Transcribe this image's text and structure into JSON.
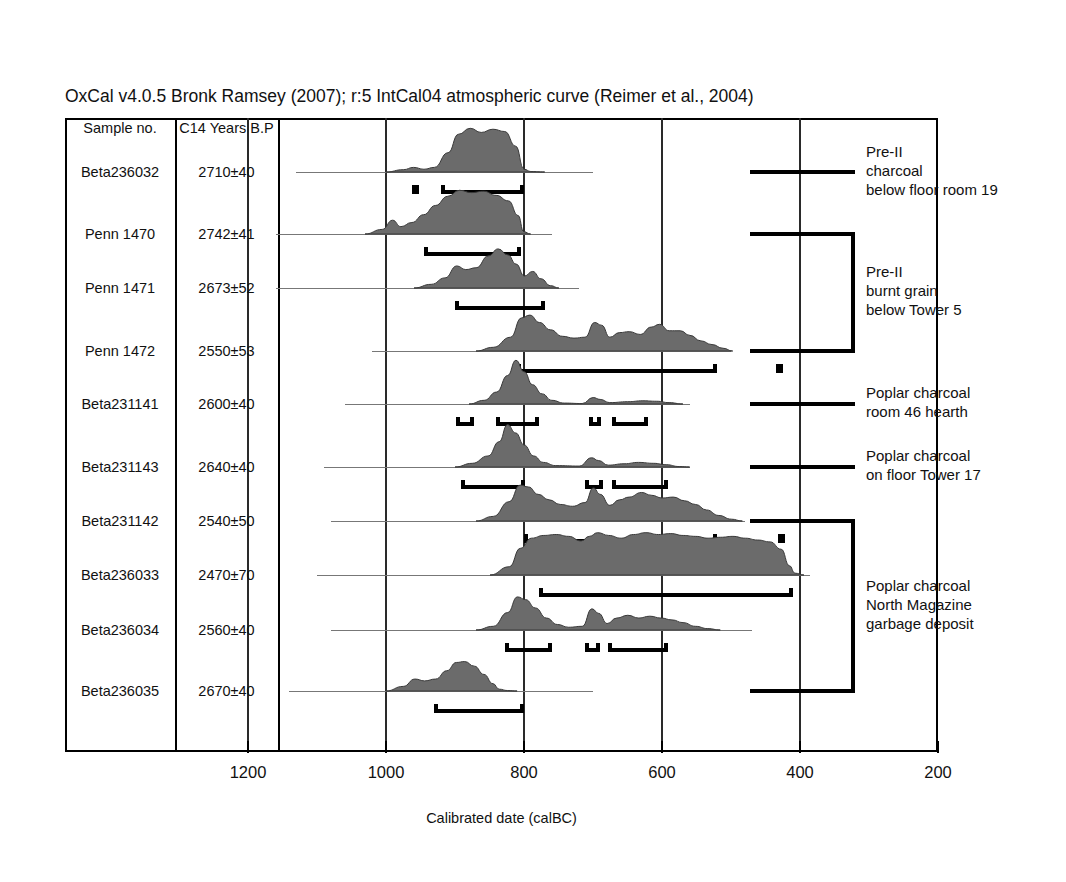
{
  "title": "OxCal v4.0.5 Bronk Ramsey (2007); r:5 IntCal04 atmospheric curve (Reimer et al., 2004)",
  "axis": {
    "label": "Calibrated date (calBC)",
    "ticks": [
      "1200",
      "1000",
      "800",
      "600",
      "400",
      "200"
    ],
    "range_left_calbc": 1330,
    "range_right_calbc": 200,
    "minor_tick_step": 20
  },
  "table": {
    "headers": [
      "Sample no.",
      "C14 Years B.P"
    ]
  },
  "samples": [
    {
      "name": "Beta236032",
      "c14": "2710±40"
    },
    {
      "name": "Penn 1470",
      "c14": "2742±41"
    },
    {
      "name": "Penn 1471",
      "c14": "2673±52"
    },
    {
      "name": "Penn 1472",
      "c14": "2550±53"
    },
    {
      "name": "Beta231141",
      "c14": "2600±40"
    },
    {
      "name": "Beta231143",
      "c14": "2640±40"
    },
    {
      "name": "Beta231142",
      "c14": "2540±50"
    },
    {
      "name": "Beta236033",
      "c14": "2470±70"
    },
    {
      "name": "Beta236034",
      "c14": "2560±40"
    },
    {
      "name": "Beta236035",
      "c14": "2670±40"
    }
  ],
  "groups": [
    {
      "label_lines": [
        "Pre-II",
        "charcoal",
        "below floor room 19"
      ],
      "rows": [
        0,
        0
      ]
    },
    {
      "label_lines": [
        "Pre-II",
        "burnt grain",
        "below Tower 5"
      ],
      "rows": [
        1,
        3
      ]
    },
    {
      "label_lines": [
        "Poplar charcoal",
        "room 46 hearth"
      ],
      "rows": [
        4,
        4
      ]
    },
    {
      "label_lines": [
        "Poplar charcoal",
        "on floor Tower 17"
      ],
      "rows": [
        5,
        5
      ]
    },
    {
      "label_lines": [
        "Poplar charcoal",
        "North Magazine",
        "garbage deposit"
      ],
      "rows": [
        6,
        9
      ]
    }
  ],
  "chart_data": {
    "type": "area",
    "title": "OxCal v4.0.5 Bronk Ramsey (2007); r:5 IntCal04 atmospheric curve (Reimer et al., 2004)",
    "xlabel": "Calibrated date (calBC)",
    "ylabel": "",
    "xlim": [
      1330,
      200
    ],
    "x_axis_direction": "reversed",
    "grid": true,
    "gridlines_calbc": [
      1200,
      1000,
      800,
      600,
      400
    ],
    "legend": "none",
    "series": [
      {
        "name": "Beta236032",
        "c14_age_bp": 2710,
        "c14_error": 40,
        "baseline_calbc": [
          1130,
          700
        ],
        "pdf_calbc": [
          {
            "x": 1000,
            "y": 0.0
          },
          {
            "x": 975,
            "y": 0.05
          },
          {
            "x": 960,
            "y": 0.1
          },
          {
            "x": 945,
            "y": 0.06
          },
          {
            "x": 930,
            "y": 0.1
          },
          {
            "x": 910,
            "y": 0.42
          },
          {
            "x": 895,
            "y": 0.82
          },
          {
            "x": 878,
            "y": 0.95
          },
          {
            "x": 862,
            "y": 0.86
          },
          {
            "x": 845,
            "y": 0.93
          },
          {
            "x": 828,
            "y": 0.88
          },
          {
            "x": 812,
            "y": 0.56
          },
          {
            "x": 800,
            "y": 0.06
          },
          {
            "x": 790,
            "y": 0.01
          },
          {
            "x": 770,
            "y": 0.0
          }
        ],
        "ranges_calbc": [
          [
            963,
            952
          ],
          [
            920,
            800
          ]
        ]
      },
      {
        "name": "Penn 1470",
        "c14_age_bp": 2742,
        "c14_error": 41,
        "baseline_calbc": [
          1160,
          760
        ],
        "pdf_calbc": [
          {
            "x": 1030,
            "y": 0.0
          },
          {
            "x": 1005,
            "y": 0.1
          },
          {
            "x": 990,
            "y": 0.3
          },
          {
            "x": 978,
            "y": 0.16
          },
          {
            "x": 962,
            "y": 0.25
          },
          {
            "x": 945,
            "y": 0.42
          },
          {
            "x": 928,
            "y": 0.62
          },
          {
            "x": 910,
            "y": 0.82
          },
          {
            "x": 893,
            "y": 0.95
          },
          {
            "x": 876,
            "y": 0.9
          },
          {
            "x": 858,
            "y": 0.93
          },
          {
            "x": 840,
            "y": 0.84
          },
          {
            "x": 822,
            "y": 0.72
          },
          {
            "x": 808,
            "y": 0.4
          },
          {
            "x": 800,
            "y": 0.05
          },
          {
            "x": 790,
            "y": 0.0
          }
        ],
        "ranges_calbc": [
          [
            945,
            805
          ]
        ]
      },
      {
        "name": "Penn 1471",
        "c14_age_bp": 2673,
        "c14_error": 52,
        "baseline_calbc": [
          1160,
          720
        ],
        "pdf_calbc": [
          {
            "x": 960,
            "y": 0.0
          },
          {
            "x": 935,
            "y": 0.08
          },
          {
            "x": 915,
            "y": 0.22
          },
          {
            "x": 898,
            "y": 0.48
          },
          {
            "x": 885,
            "y": 0.4
          },
          {
            "x": 870,
            "y": 0.44
          },
          {
            "x": 852,
            "y": 0.7
          },
          {
            "x": 838,
            "y": 0.85
          },
          {
            "x": 824,
            "y": 0.72
          },
          {
            "x": 812,
            "y": 0.52
          },
          {
            "x": 800,
            "y": 0.26
          },
          {
            "x": 788,
            "y": 0.36
          },
          {
            "x": 776,
            "y": 0.2
          },
          {
            "x": 762,
            "y": 0.05
          },
          {
            "x": 750,
            "y": 0.0
          }
        ],
        "ranges_calbc": [
          [
            900,
            770
          ]
        ]
      },
      {
        "name": "Penn 1472",
        "c14_age_bp": 2550,
        "c14_error": 53,
        "baseline_calbc": [
          1020,
          500
        ],
        "pdf_calbc": [
          {
            "x": 870,
            "y": 0.0
          },
          {
            "x": 845,
            "y": 0.08
          },
          {
            "x": 820,
            "y": 0.3
          },
          {
            "x": 804,
            "y": 0.72
          },
          {
            "x": 792,
            "y": 0.78
          },
          {
            "x": 778,
            "y": 0.62
          },
          {
            "x": 762,
            "y": 0.46
          },
          {
            "x": 745,
            "y": 0.32
          },
          {
            "x": 728,
            "y": 0.28
          },
          {
            "x": 712,
            "y": 0.3
          },
          {
            "x": 698,
            "y": 0.62
          },
          {
            "x": 688,
            "y": 0.56
          },
          {
            "x": 676,
            "y": 0.3
          },
          {
            "x": 662,
            "y": 0.4
          },
          {
            "x": 648,
            "y": 0.42
          },
          {
            "x": 632,
            "y": 0.36
          },
          {
            "x": 616,
            "y": 0.52
          },
          {
            "x": 604,
            "y": 0.58
          },
          {
            "x": 590,
            "y": 0.44
          },
          {
            "x": 574,
            "y": 0.44
          },
          {
            "x": 560,
            "y": 0.34
          },
          {
            "x": 544,
            "y": 0.22
          },
          {
            "x": 528,
            "y": 0.14
          },
          {
            "x": 512,
            "y": 0.06
          },
          {
            "x": 498,
            "y": 0.0
          }
        ],
        "ranges_calbc": [
          [
            810,
            520
          ],
          [
            435,
            425
          ]
        ]
      },
      {
        "name": "Beta231141",
        "c14_age_bp": 2600,
        "c14_error": 40,
        "baseline_calbc": [
          1060,
          560
        ],
        "pdf_calbc": [
          {
            "x": 880,
            "y": 0.0
          },
          {
            "x": 858,
            "y": 0.08
          },
          {
            "x": 840,
            "y": 0.26
          },
          {
            "x": 824,
            "y": 0.62
          },
          {
            "x": 812,
            "y": 0.95
          },
          {
            "x": 800,
            "y": 0.7
          },
          {
            "x": 788,
            "y": 0.42
          },
          {
            "x": 774,
            "y": 0.22
          },
          {
            "x": 760,
            "y": 0.08
          },
          {
            "x": 742,
            "y": 0.02
          },
          {
            "x": 716,
            "y": 0.01
          },
          {
            "x": 700,
            "y": 0.14
          },
          {
            "x": 690,
            "y": 0.1
          },
          {
            "x": 676,
            "y": 0.03
          },
          {
            "x": 650,
            "y": 0.05
          },
          {
            "x": 628,
            "y": 0.07
          },
          {
            "x": 608,
            "y": 0.06
          },
          {
            "x": 590,
            "y": 0.03
          },
          {
            "x": 570,
            "y": 0.0
          }
        ],
        "ranges_calbc": [
          [
            898,
            872
          ],
          [
            840,
            778
          ],
          [
            706,
            688
          ],
          [
            672,
            620
          ]
        ]
      },
      {
        "name": "Beta231143",
        "c14_age_bp": 2640,
        "c14_error": 40,
        "baseline_calbc": [
          1090,
          560
        ],
        "pdf_calbc": [
          {
            "x": 900,
            "y": 0.0
          },
          {
            "x": 875,
            "y": 0.08
          },
          {
            "x": 852,
            "y": 0.24
          },
          {
            "x": 836,
            "y": 0.55
          },
          {
            "x": 824,
            "y": 0.92
          },
          {
            "x": 812,
            "y": 0.74
          },
          {
            "x": 800,
            "y": 0.48
          },
          {
            "x": 786,
            "y": 0.24
          },
          {
            "x": 772,
            "y": 0.1
          },
          {
            "x": 754,
            "y": 0.03
          },
          {
            "x": 720,
            "y": 0.02
          },
          {
            "x": 702,
            "y": 0.2
          },
          {
            "x": 692,
            "y": 0.14
          },
          {
            "x": 678,
            "y": 0.04
          },
          {
            "x": 655,
            "y": 0.07
          },
          {
            "x": 634,
            "y": 0.1
          },
          {
            "x": 612,
            "y": 0.08
          },
          {
            "x": 594,
            "y": 0.05
          },
          {
            "x": 575,
            "y": 0.01
          },
          {
            "x": 560,
            "y": 0.0
          }
        ],
        "ranges_calbc": [
          [
            892,
            798
          ],
          [
            712,
            686
          ],
          [
            672,
            592
          ]
        ]
      },
      {
        "name": "Beta231142",
        "c14_age_bp": 2540,
        "c14_error": 50,
        "baseline_calbc": [
          1080,
          480
        ],
        "pdf_calbc": [
          {
            "x": 870,
            "y": 0.0
          },
          {
            "x": 845,
            "y": 0.1
          },
          {
            "x": 822,
            "y": 0.42
          },
          {
            "x": 806,
            "y": 0.78
          },
          {
            "x": 794,
            "y": 0.74
          },
          {
            "x": 780,
            "y": 0.58
          },
          {
            "x": 764,
            "y": 0.46
          },
          {
            "x": 748,
            "y": 0.36
          },
          {
            "x": 730,
            "y": 0.32
          },
          {
            "x": 712,
            "y": 0.4
          },
          {
            "x": 700,
            "y": 0.72
          },
          {
            "x": 690,
            "y": 0.58
          },
          {
            "x": 676,
            "y": 0.34
          },
          {
            "x": 662,
            "y": 0.46
          },
          {
            "x": 648,
            "y": 0.52
          },
          {
            "x": 630,
            "y": 0.62
          },
          {
            "x": 616,
            "y": 0.56
          },
          {
            "x": 600,
            "y": 0.5
          },
          {
            "x": 584,
            "y": 0.52
          },
          {
            "x": 568,
            "y": 0.44
          },
          {
            "x": 552,
            "y": 0.36
          },
          {
            "x": 536,
            "y": 0.24
          },
          {
            "x": 518,
            "y": 0.12
          },
          {
            "x": 500,
            "y": 0.04
          },
          {
            "x": 484,
            "y": 0.0
          }
        ],
        "ranges_calbc": [
          [
            800,
            520
          ],
          [
            432,
            422
          ]
        ]
      },
      {
        "name": "Beta236033",
        "c14_age_bp": 2470,
        "c14_error": 70,
        "baseline_calbc": [
          1100,
          385
        ],
        "pdf_calbc": [
          {
            "x": 850,
            "y": 0.0
          },
          {
            "x": 822,
            "y": 0.18
          },
          {
            "x": 806,
            "y": 0.58
          },
          {
            "x": 790,
            "y": 0.8
          },
          {
            "x": 772,
            "y": 0.86
          },
          {
            "x": 754,
            "y": 0.88
          },
          {
            "x": 736,
            "y": 0.84
          },
          {
            "x": 718,
            "y": 0.74
          },
          {
            "x": 706,
            "y": 0.84
          },
          {
            "x": 694,
            "y": 0.92
          },
          {
            "x": 678,
            "y": 0.86
          },
          {
            "x": 660,
            "y": 0.8
          },
          {
            "x": 642,
            "y": 0.88
          },
          {
            "x": 624,
            "y": 0.92
          },
          {
            "x": 606,
            "y": 0.88
          },
          {
            "x": 588,
            "y": 0.9
          },
          {
            "x": 570,
            "y": 0.86
          },
          {
            "x": 552,
            "y": 0.84
          },
          {
            "x": 534,
            "y": 0.8
          },
          {
            "x": 516,
            "y": 0.82
          },
          {
            "x": 498,
            "y": 0.84
          },
          {
            "x": 480,
            "y": 0.8
          },
          {
            "x": 462,
            "y": 0.76
          },
          {
            "x": 444,
            "y": 0.72
          },
          {
            "x": 428,
            "y": 0.56
          },
          {
            "x": 416,
            "y": 0.2
          },
          {
            "x": 408,
            "y": 0.04
          },
          {
            "x": 395,
            "y": 0.0
          }
        ],
        "ranges_calbc": [
          [
            778,
            410
          ]
        ]
      },
      {
        "name": "Beta236034",
        "c14_age_bp": 2560,
        "c14_error": 40,
        "baseline_calbc": [
          1080,
          470
        ],
        "pdf_calbc": [
          {
            "x": 870,
            "y": 0.0
          },
          {
            "x": 845,
            "y": 0.08
          },
          {
            "x": 824,
            "y": 0.38
          },
          {
            "x": 810,
            "y": 0.72
          },
          {
            "x": 798,
            "y": 0.66
          },
          {
            "x": 784,
            "y": 0.48
          },
          {
            "x": 768,
            "y": 0.26
          },
          {
            "x": 752,
            "y": 0.12
          },
          {
            "x": 736,
            "y": 0.06
          },
          {
            "x": 716,
            "y": 0.08
          },
          {
            "x": 702,
            "y": 0.46
          },
          {
            "x": 692,
            "y": 0.36
          },
          {
            "x": 680,
            "y": 0.14
          },
          {
            "x": 666,
            "y": 0.26
          },
          {
            "x": 650,
            "y": 0.32
          },
          {
            "x": 634,
            "y": 0.26
          },
          {
            "x": 618,
            "y": 0.3
          },
          {
            "x": 602,
            "y": 0.26
          },
          {
            "x": 586,
            "y": 0.22
          },
          {
            "x": 570,
            "y": 0.16
          },
          {
            "x": 552,
            "y": 0.08
          },
          {
            "x": 534,
            "y": 0.03
          },
          {
            "x": 516,
            "y": 0.0
          }
        ],
        "ranges_calbc": [
          [
            828,
            760
          ],
          [
            712,
            690
          ],
          [
            678,
            592
          ]
        ]
      },
      {
        "name": "Beta236035",
        "c14_age_bp": 2670,
        "c14_error": 40,
        "baseline_calbc": [
          1140,
          700
        ],
        "pdf_calbc": [
          {
            "x": 1000,
            "y": 0.0
          },
          {
            "x": 975,
            "y": 0.1
          },
          {
            "x": 958,
            "y": 0.26
          },
          {
            "x": 944,
            "y": 0.22
          },
          {
            "x": 928,
            "y": 0.26
          },
          {
            "x": 912,
            "y": 0.44
          },
          {
            "x": 898,
            "y": 0.62
          },
          {
            "x": 886,
            "y": 0.64
          },
          {
            "x": 872,
            "y": 0.54
          },
          {
            "x": 858,
            "y": 0.36
          },
          {
            "x": 845,
            "y": 0.16
          },
          {
            "x": 836,
            "y": 0.04
          },
          {
            "x": 824,
            "y": 0.01
          },
          {
            "x": 810,
            "y": 0.0
          }
        ],
        "ranges_calbc": [
          [
            930,
            800
          ]
        ]
      }
    ]
  }
}
